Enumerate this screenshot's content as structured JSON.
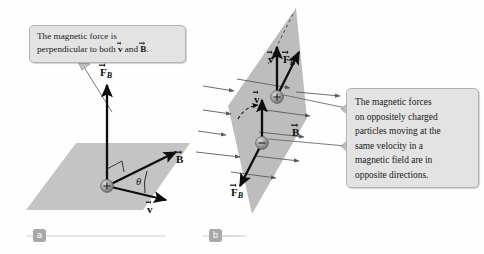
{
  "figure": {
    "background_color": "#fefefe",
    "plane_fill": "#c4c4c4",
    "plane_fill_right": "#bdbdbd",
    "vector_color": "#0d0d0d",
    "fieldline_color": "#5a5a5a",
    "callout_bg": "#e3e3e3",
    "callout_border": "#b4b4b4",
    "chip_color": "#a8a8a8"
  },
  "callouts": {
    "left": {
      "line1_a": "The magnetic force is",
      "line2_a": "perpendicular to both ",
      "line2_v": "v",
      "line2_b": " and ",
      "line2_bfield": "B",
      "line2_end": "."
    },
    "right": {
      "line1": "The magnetic forces",
      "line2": "on oppositely charged",
      "line3": "particles moving at the",
      "line4": "same velocity in a",
      "line5": "magnetic field are in",
      "line6": "opposite directions."
    }
  },
  "panel_a": {
    "letter": "a",
    "labels": {
      "force": "F",
      "force_sub": "B",
      "bfield": "B",
      "velocity": "v",
      "angle": "θ"
    },
    "particle_charge": "+"
  },
  "panel_b": {
    "letter": "b",
    "upper_particle": {
      "charge": "+",
      "velocity": "v",
      "force": "F",
      "force_sub": "B"
    },
    "lower_particle": {
      "charge": "−",
      "velocity": "v",
      "force": "F",
      "force_sub": "B"
    },
    "bfield": "B"
  }
}
